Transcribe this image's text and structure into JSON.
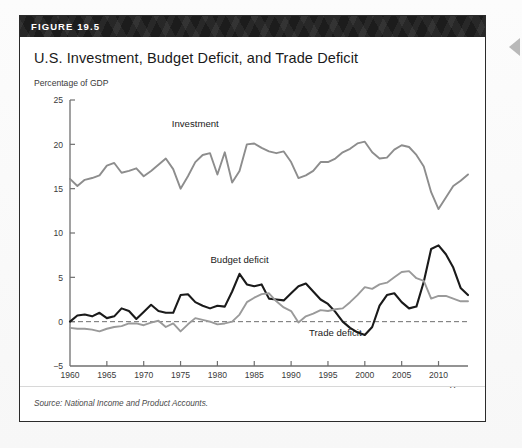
{
  "figure": {
    "number_label": "FIGURE 19.5",
    "title": "U.S. Investment, Budget Deficit, and Trade Deficit",
    "source_note": "Source: National Income and Product Accounts."
  },
  "colors": {
    "header_bg": "#1c1c1c",
    "header_text": "#ffffff",
    "investment_line": "#8d8d8d",
    "budget_deficit_line": "#1a1a1a",
    "trade_deficit_line": "#9a9a9a",
    "zero_line": "#6f6f6f",
    "axis": "#6f6f6f"
  },
  "chart_data": {
    "type": "line",
    "title": "U.S. Investment, Budget Deficit, and Trade Deficit",
    "xlabel": "Year",
    "ylabel": "Percentage of GDP",
    "ylim": [
      -5,
      25
    ],
    "xlim": [
      1960,
      2014
    ],
    "yticks": [
      -5,
      0,
      5,
      10,
      15,
      20,
      25
    ],
    "xticks": [
      1960,
      1965,
      1970,
      1975,
      1980,
      1985,
      1990,
      1995,
      2000,
      2005,
      2010
    ],
    "grid": false,
    "legend": "inline-annotations",
    "zero_reference_line": 0,
    "annotations": [
      {
        "label": "Investment",
        "x": 1977,
        "y": 22.0
      },
      {
        "label": "Budget deficit",
        "x": 1983,
        "y": 6.6
      },
      {
        "label": "Trade deficit",
        "x": 1996,
        "y": -1.6
      }
    ],
    "x": [
      1960,
      1961,
      1962,
      1963,
      1964,
      1965,
      1966,
      1967,
      1968,
      1969,
      1970,
      1971,
      1972,
      1973,
      1974,
      1975,
      1976,
      1977,
      1978,
      1979,
      1980,
      1981,
      1982,
      1983,
      1984,
      1985,
      1986,
      1987,
      1988,
      1989,
      1990,
      1991,
      1992,
      1993,
      1994,
      1995,
      1996,
      1997,
      1998,
      1999,
      2000,
      2001,
      2002,
      2003,
      2004,
      2005,
      2006,
      2007,
      2008,
      2009,
      2010,
      2011,
      2012,
      2013,
      2014
    ],
    "series": [
      {
        "name": "Investment",
        "color": "#8d8d8d",
        "values": [
          16.1,
          15.3,
          16.0,
          16.2,
          16.5,
          17.6,
          17.9,
          16.8,
          17.0,
          17.3,
          16.4,
          17.0,
          17.7,
          18.4,
          17.2,
          15.0,
          16.4,
          18.0,
          18.8,
          19.0,
          16.6,
          19.1,
          15.7,
          17.0,
          20.0,
          20.1,
          19.6,
          19.2,
          19.0,
          19.2,
          18.0,
          16.2,
          16.5,
          17.0,
          18.0,
          18.0,
          18.4,
          19.1,
          19.5,
          20.1,
          20.3,
          19.1,
          18.4,
          18.5,
          19.4,
          19.9,
          19.7,
          18.8,
          17.5,
          14.6,
          12.7,
          14.0,
          15.3,
          15.9,
          16.6
        ]
      },
      {
        "name": "Budget deficit",
        "color": "#1a1a1a",
        "values": [
          0.0,
          0.7,
          0.8,
          0.6,
          1.0,
          0.4,
          0.6,
          1.5,
          1.2,
          0.3,
          1.1,
          1.9,
          1.2,
          1.0,
          1.0,
          3.0,
          3.1,
          2.2,
          1.8,
          1.5,
          1.8,
          1.7,
          3.4,
          5.4,
          4.2,
          4.0,
          4.2,
          2.6,
          2.5,
          2.4,
          3.2,
          4.0,
          4.3,
          3.4,
          2.5,
          2.0,
          1.1,
          0.0,
          -0.7,
          -1.2,
          -1.5,
          -0.6,
          1.8,
          3.0,
          3.2,
          2.2,
          1.5,
          1.7,
          4.5,
          8.2,
          8.6,
          7.6,
          6.1,
          3.8,
          3.0
        ]
      },
      {
        "name": "Trade deficit",
        "color": "#9a9a9a",
        "values": [
          -0.7,
          -0.8,
          -0.8,
          -0.9,
          -1.1,
          -0.8,
          -0.6,
          -0.5,
          -0.2,
          -0.2,
          -0.4,
          -0.1,
          0.1,
          -0.6,
          -0.2,
          -1.1,
          -0.3,
          0.4,
          0.2,
          0.0,
          -0.3,
          -0.2,
          0.0,
          0.8,
          2.2,
          2.7,
          3.1,
          3.2,
          2.3,
          1.6,
          1.2,
          -0.1,
          0.6,
          0.9,
          1.3,
          1.2,
          1.4,
          1.5,
          2.2,
          3.0,
          3.9,
          3.7,
          4.2,
          4.4,
          5.0,
          5.6,
          5.7,
          4.9,
          4.6,
          2.6,
          2.9,
          2.9,
          2.6,
          2.3,
          2.3
        ]
      }
    ]
  }
}
